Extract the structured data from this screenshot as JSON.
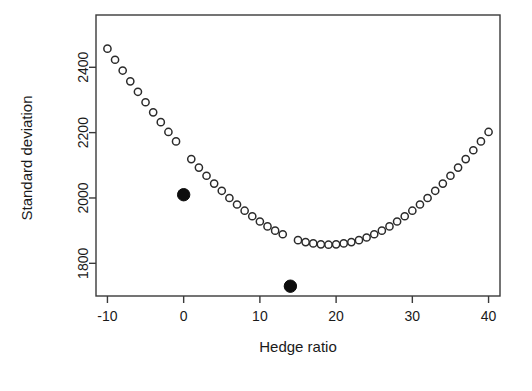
{
  "figure": {
    "title": "",
    "background": "#ffffff",
    "frame_color": "#3a3a3a",
    "point_color": "#2b2b2b",
    "highlight_color": "#0d0d0d"
  },
  "chart_data": {
    "type": "scatter",
    "title": "",
    "xlabel": "Hedge ratio",
    "ylabel": "Standard deviation",
    "xlim": [
      -11.5,
      41.5
    ],
    "ylim": [
      1700,
      2560
    ],
    "xticks": [
      -10,
      0,
      10,
      20,
      30,
      40
    ],
    "xtick_labels": [
      "-10",
      "0",
      "10",
      "20",
      "30",
      "40"
    ],
    "yticks": [
      1800,
      2000,
      2200,
      2400
    ],
    "ytick_labels": [
      "1800",
      "2000",
      "2200",
      "2400"
    ],
    "grid": false,
    "legend": null,
    "marker_open": "circle-open",
    "marker_filled": "circle-filled",
    "series": [
      {
        "name": "Portfolio standard deviation vs hedge ratio",
        "x": [
          -10,
          -9,
          -8,
          -7,
          -6,
          -5,
          -4,
          -3,
          -2,
          -1,
          0,
          1,
          2,
          3,
          4,
          5,
          6,
          7,
          8,
          9,
          10,
          11,
          12,
          13,
          14,
          15,
          16,
          17,
          18,
          19,
          20,
          21,
          22,
          23,
          24,
          25,
          26,
          27,
          28,
          29,
          30,
          31,
          32,
          33,
          34,
          35,
          36,
          37,
          38,
          39,
          40
        ],
        "y": [
          2457,
          2423,
          2390,
          2357,
          2325,
          2293,
          2262,
          2232,
          2202,
          2173,
          2146,
          2119,
          2093,
          2068,
          2044,
          2022,
          2000,
          1980,
          1961,
          1944,
          1928,
          1913,
          1900,
          1889,
          1879,
          1871,
          1865,
          1861,
          1858,
          1857,
          1858,
          1861,
          1865,
          1871,
          1879,
          1889,
          1900,
          1913,
          1928,
          1944,
          1961,
          1980,
          2000,
          2022,
          2044,
          2068,
          2093,
          2119,
          2146,
          2173,
          2202
        ],
        "filled_indices": [
          10,
          24
        ]
      }
    ],
    "highlighted_points": [
      {
        "label": "unhedged",
        "x": 0,
        "y": 2010
      },
      {
        "label": "minimum-variance",
        "x": 14,
        "y": 1730
      }
    ]
  }
}
